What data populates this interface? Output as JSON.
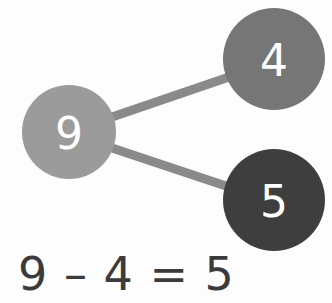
{
  "figure": {
    "type": "number-bond-subtraction",
    "background_color": "#fdfdfd",
    "label_text_color": "#ffffff"
  },
  "nodes": [
    {
      "id": "whole",
      "role": "whole",
      "value": "9",
      "color": "#9b9b9b",
      "cx": 69,
      "cy": 132,
      "r": 47
    },
    {
      "id": "part-one",
      "role": "part",
      "value": "4",
      "color": "#767676",
      "cx": 274,
      "cy": 59,
      "r": 51
    },
    {
      "id": "part-two",
      "role": "part",
      "value": "5",
      "color": "#3e3e3e",
      "cx": 274,
      "cy": 200,
      "r": 51
    }
  ],
  "connectors": [
    {
      "id": "connector-whole-to-part-one",
      "from": "whole",
      "to": "part-one",
      "color": "#8a8a8a",
      "width": 9,
      "x1": 112,
      "y1": 117,
      "x2": 232,
      "y2": 76
    },
    {
      "id": "connector-whole-to-part-two",
      "from": "whole",
      "to": "part-two",
      "color": "#8a8a8a",
      "width": 9,
      "x1": 112,
      "y1": 148,
      "x2": 232,
      "y2": 188
    }
  ],
  "equation": {
    "text": "9 – 4 = 5",
    "minuend": "9",
    "operator": "–",
    "subtrahend": "4",
    "equals": "=",
    "difference": "5",
    "color": "#3b3b3b"
  },
  "chart_data": {
    "type": "diagram",
    "title": "9 – 4 = 5",
    "categories": [
      "9",
      "4",
      "5"
    ],
    "values": [
      9,
      4,
      5
    ],
    "series": [
      {
        "name": "number-bond",
        "values": [
          9,
          4,
          5
        ]
      }
    ],
    "annotations": [
      "9 – 4 = 5"
    ],
    "xlabel": "",
    "ylabel": ""
  }
}
